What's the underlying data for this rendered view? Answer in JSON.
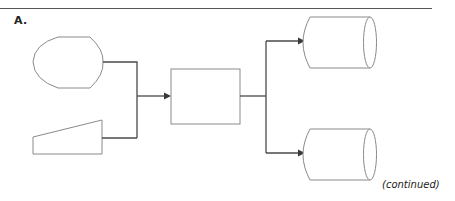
{
  "header": {
    "section_label": "A."
  },
  "footer": {
    "continued_label": "(continued)"
  },
  "diagram": {
    "type": "flowchart",
    "nodes": [
      {
        "id": "display",
        "shape": "display",
        "label": ""
      },
      {
        "id": "manual-input",
        "shape": "manual-input",
        "label": ""
      },
      {
        "id": "process",
        "shape": "process-rectangle",
        "label": ""
      },
      {
        "id": "storage-top",
        "shape": "direct-access-storage-cylinder",
        "label": ""
      },
      {
        "id": "storage-bottom",
        "shape": "direct-access-storage-cylinder",
        "label": ""
      }
    ],
    "edges": [
      {
        "from": "display",
        "to": "process",
        "arrow": true
      },
      {
        "from": "manual-input",
        "to": "process",
        "arrow": true
      },
      {
        "from": "process",
        "to": "storage-top",
        "arrow": true
      },
      {
        "from": "process",
        "to": "storage-bottom",
        "arrow": true
      }
    ],
    "colors": {
      "shape_stroke": "#8a8a8a",
      "connector": "#4a4a4a",
      "background": "#ffffff"
    }
  }
}
